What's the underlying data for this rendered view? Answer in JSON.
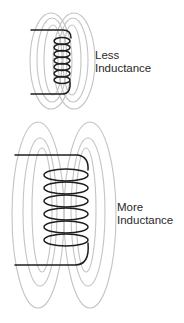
{
  "diagram": {
    "colors": {
      "background": "#ffffff",
      "wire": "#1e1e1e",
      "field_lines": "#c4c4c4",
      "text": "#2a2a2a"
    },
    "coils": [
      {
        "id": "small-coil",
        "label_line1": "Less",
        "label_line2": "Inductance",
        "turns": 7
      },
      {
        "id": "large-coil",
        "label_line1": "More",
        "label_line2": "Inductance",
        "turns": 6
      }
    ]
  }
}
